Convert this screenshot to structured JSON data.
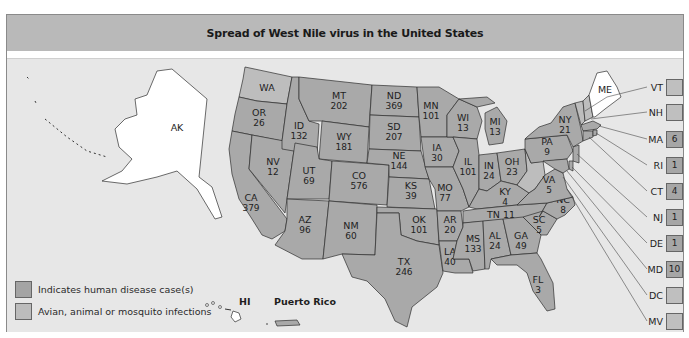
{
  "header": {
    "title": "Spread of West Nile virus in the United States"
  },
  "legend": {
    "items": [
      {
        "label": "Indicates human disease case(s)",
        "color": "#a4a4a4"
      },
      {
        "label": "Avian, animal or mosquito infections",
        "color": "#bcbcbc"
      }
    ]
  },
  "territories": {
    "hawaii_label": "HI",
    "puerto_rico_label": "Puerto Rico"
  },
  "states": {
    "AK": {
      "name": "AK",
      "cases": ""
    },
    "WA": {
      "name": "WA",
      "cases": ""
    },
    "OR": {
      "name": "OR",
      "cases": "26"
    },
    "CA": {
      "name": "CA",
      "cases": "379"
    },
    "ID": {
      "name": "ID",
      "cases": "132"
    },
    "NV": {
      "name": "NV",
      "cases": "12"
    },
    "MT": {
      "name": "MT",
      "cases": "202"
    },
    "WY": {
      "name": "WY",
      "cases": "181"
    },
    "UT": {
      "name": "UT",
      "cases": "69"
    },
    "AZ": {
      "name": "AZ",
      "cases": "96"
    },
    "CO": {
      "name": "CO",
      "cases": "576"
    },
    "NM": {
      "name": "NM",
      "cases": "60"
    },
    "ND": {
      "name": "ND",
      "cases": "369"
    },
    "SD": {
      "name": "SD",
      "cases": "207"
    },
    "NE": {
      "name": "NE",
      "cases": "144"
    },
    "KS": {
      "name": "KS",
      "cases": "39"
    },
    "OK": {
      "name": "OK",
      "cases": "101"
    },
    "TX": {
      "name": "TX",
      "cases": "246"
    },
    "MN": {
      "name": "MN",
      "cases": "101"
    },
    "IA": {
      "name": "IA",
      "cases": "30"
    },
    "MO": {
      "name": "MO",
      "cases": "77"
    },
    "AR": {
      "name": "AR",
      "cases": "20"
    },
    "LA": {
      "name": "LA",
      "cases": "40"
    },
    "WI": {
      "name": "WI",
      "cases": "13"
    },
    "IL": {
      "name": "IL",
      "cases": "101"
    },
    "MI": {
      "name": "MI",
      "cases": "13"
    },
    "IN": {
      "name": "IN",
      "cases": "24"
    },
    "OH": {
      "name": "OH",
      "cases": "23"
    },
    "KY": {
      "name": "KY",
      "cases": "4"
    },
    "TN": {
      "name": "TN",
      "cases": "11"
    },
    "MS": {
      "name": "MS",
      "cases": "133"
    },
    "AL": {
      "name": "AL",
      "cases": "24"
    },
    "GA": {
      "name": "GA",
      "cases": "49"
    },
    "FL": {
      "name": "FL",
      "cases": "3"
    },
    "SC": {
      "name": "SC",
      "cases": "5"
    },
    "NC": {
      "name": "NC",
      "cases": "8"
    },
    "VA": {
      "name": "VA",
      "cases": "5"
    },
    "PA": {
      "name": "PA",
      "cases": "9"
    },
    "NY": {
      "name": "NY",
      "cases": "21"
    },
    "ME": {
      "name": "ME",
      "cases": ""
    }
  },
  "callouts": [
    {
      "state": "VT",
      "cases": ""
    },
    {
      "state": "NH",
      "cases": ""
    },
    {
      "state": "MA",
      "cases": "6"
    },
    {
      "state": "RI",
      "cases": "1"
    },
    {
      "state": "CT",
      "cases": "4"
    },
    {
      "state": "NJ",
      "cases": "1"
    },
    {
      "state": "DE",
      "cases": "1"
    },
    {
      "state": "MD",
      "cases": "10"
    },
    {
      "state": "DC",
      "cases": ""
    },
    {
      "state": "MV",
      "cases": ""
    }
  ],
  "colors": {
    "header_bg": "#b9b9b9",
    "map_bg": "#e7e7e7",
    "human_case_fill": "#a9a9a9",
    "avian_fill": "#bdbdbd",
    "no_infection_fill": "#ffffff"
  }
}
